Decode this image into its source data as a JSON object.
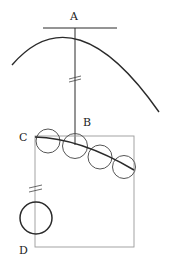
{
  "diagram": {
    "labels": {
      "a": "A",
      "b": "B",
      "c": "C",
      "d": "D"
    },
    "colors": {
      "ink": "#2a2a2a",
      "light_ink": "#9a9a9a",
      "background": "#ffffff"
    }
  }
}
